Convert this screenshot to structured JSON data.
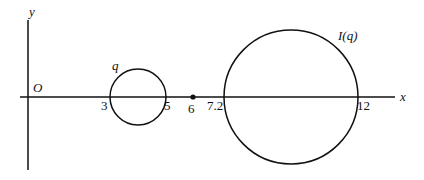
{
  "diagram": {
    "axes": {
      "x_label": "x",
      "y_label": "y",
      "origin_label": "O"
    },
    "small_circle": {
      "label": "q",
      "left_tick": "3",
      "right_tick": "5",
      "center": 4,
      "radius": 1
    },
    "point": {
      "tick": "6",
      "value": 6
    },
    "large_circle": {
      "label": "I(q)",
      "left_tick": "7.2",
      "right_tick": "12",
      "center": 9.6,
      "radius": 2.4
    },
    "stroke_color": "#111111"
  }
}
